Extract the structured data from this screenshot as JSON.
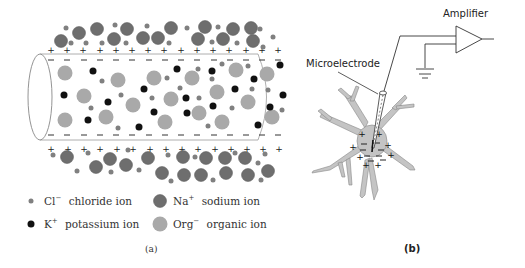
{
  "figure": {
    "panel_a": {
      "caption": "(a)",
      "legend": [
        {
          "symbol": "Cl",
          "charge": "−",
          "label": "chloride ion",
          "color": "#7f7f7f",
          "size": "small"
        },
        {
          "symbol": "Na",
          "charge": "+",
          "label": "sodium ion",
          "color": "#6e6e6e",
          "size": "large"
        },
        {
          "symbol": "K",
          "charge": "+",
          "label": "potassium ion",
          "color": "#111111",
          "size": "medium"
        },
        {
          "symbol": "Org",
          "charge": "−",
          "label": "organic ion",
          "color": "#a8a8a8",
          "size": "large"
        }
      ],
      "membrane_outside_charge": "+",
      "membrane_inside_charge": "−"
    },
    "panel_b": {
      "caption": "(b)",
      "amplifier_label": "Amplifier",
      "electrode_label": "Microelectrode"
    }
  },
  "colors": {
    "sodium": "#6e6e6e",
    "chloride": "#808080",
    "potassium": "#111111",
    "organic": "#a9a9a9",
    "neuron": "#c4c4c4",
    "line": "#333333"
  }
}
